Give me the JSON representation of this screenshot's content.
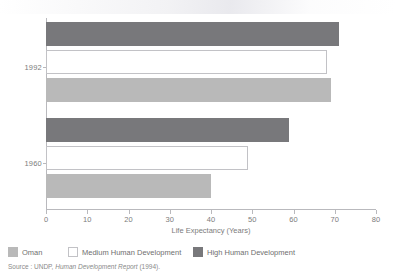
{
  "chart_data": {
    "type": "bar",
    "orientation": "horizontal",
    "title": "",
    "xlabel": "Life Expectancy (Years)",
    "ylabel": "",
    "xlim": [
      0,
      80
    ],
    "xticks": [
      0,
      10,
      20,
      30,
      40,
      50,
      60,
      70,
      80
    ],
    "xtick_labels": [
      "0",
      "10",
      "20",
      "30",
      "40",
      "50",
      "60",
      "70",
      "80"
    ],
    "grid": false,
    "categories": [
      "1992",
      "1960"
    ],
    "legend_position": "bottom",
    "series": [
      {
        "name": "Oman",
        "color": "#b9b9b9",
        "values": [
          69,
          40
        ]
      },
      {
        "name": "Medium Human Development",
        "color": "#ffffff",
        "values": [
          68,
          49
        ]
      },
      {
        "name": "High Human Development",
        "color": "#78787b",
        "values": [
          71,
          59
        ]
      }
    ],
    "bar_order_within_group": [
      "High Human Development",
      "Medium Human Development",
      "Oman"
    ]
  },
  "axis": {
    "x_title": "Life Expectancy (Years)",
    "ticks": [
      {
        "value": 0,
        "label": "0"
      },
      {
        "value": 10,
        "label": "10"
      },
      {
        "value": 20,
        "label": "20"
      },
      {
        "value": 30,
        "label": "30"
      },
      {
        "value": 40,
        "label": "40"
      },
      {
        "value": 50,
        "label": "50"
      },
      {
        "value": 60,
        "label": "60"
      },
      {
        "value": 70,
        "label": "70"
      },
      {
        "value": 80,
        "label": "80"
      }
    ]
  },
  "groups": [
    {
      "label": "1992",
      "bars": [
        {
          "series": "High Human Development",
          "value": 71,
          "style": "high"
        },
        {
          "series": "Medium Human Development",
          "value": 68,
          "style": "medium"
        },
        {
          "series": "Oman",
          "value": 69,
          "style": "oman"
        }
      ]
    },
    {
      "label": "1960",
      "bars": [
        {
          "series": "High Human Development",
          "value": 59,
          "style": "high"
        },
        {
          "series": "Medium Human Development",
          "value": 49,
          "style": "medium"
        },
        {
          "series": "Oman",
          "value": 40,
          "style": "oman"
        }
      ]
    }
  ],
  "legend": {
    "items": [
      {
        "label": "Oman",
        "style": "oman"
      },
      {
        "label": "Medium Human Development",
        "style": "medium"
      },
      {
        "label": "High Human Development",
        "style": "high"
      }
    ]
  },
  "source": {
    "prefix": "Source : UNDP, ",
    "italic": "Human Development Report",
    "suffix": " (1994)."
  },
  "colors": {
    "high": "#78787b",
    "medium": "#ffffff",
    "medium_border": "#c2c2c6",
    "oman": "#b9b9b9",
    "axis": "#b9b9bd",
    "text": "#7c7c7c"
  }
}
